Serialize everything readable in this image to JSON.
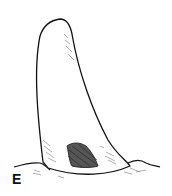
{
  "figure": {
    "panel_label": "E",
    "colors": {
      "ink": "#111111",
      "background": "#ffffff",
      "hatch_dark": "#333333",
      "stipple": "#777777"
    }
  }
}
